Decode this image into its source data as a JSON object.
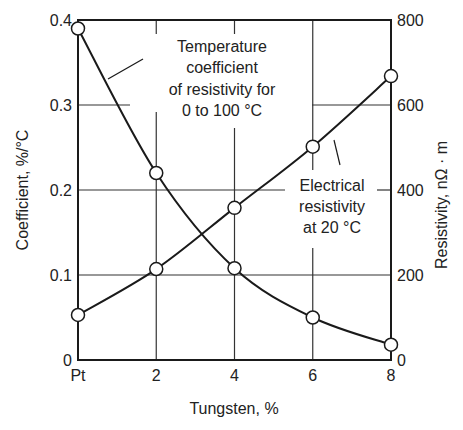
{
  "chart_data": {
    "type": "line",
    "title": "",
    "xlabel": "Tungsten, %",
    "ylabel_left": "Coefficient, %/°C",
    "ylabel_right": "Resistivity, nΩ · m",
    "x_tick_labels": [
      "Pt",
      "2",
      "4",
      "6",
      "8"
    ],
    "x": [
      0,
      2,
      4,
      6,
      8
    ],
    "xlim": [
      0,
      8
    ],
    "ylim_left": [
      0,
      0.4
    ],
    "ylim_right": [
      0,
      800
    ],
    "y_left_ticks": [
      "0",
      "0.1",
      "0.2",
      "0.3",
      "0.4"
    ],
    "y_right_ticks": [
      "0",
      "200",
      "400",
      "600",
      "800"
    ],
    "grid": true,
    "series": [
      {
        "name": "Temperature coefficient of resistivity for 0 to 100 °C",
        "axis": "left",
        "values": [
          0.39,
          0.22,
          0.108,
          0.05,
          0.018
        ],
        "annotation": [
          "Temperature",
          "coefficient",
          "of resistivity for",
          "0 to 100 °C"
        ]
      },
      {
        "name": "Electrical resistivity at 20 °C",
        "axis": "right",
        "values": [
          106,
          214,
          358,
          502,
          668
        ],
        "annotation": [
          "Electrical",
          "resistivity",
          "at 20 °C"
        ]
      }
    ],
    "colors": {
      "line": "#1a1a1a",
      "grid": "#333333",
      "marker_fill": "#ffffff"
    }
  }
}
